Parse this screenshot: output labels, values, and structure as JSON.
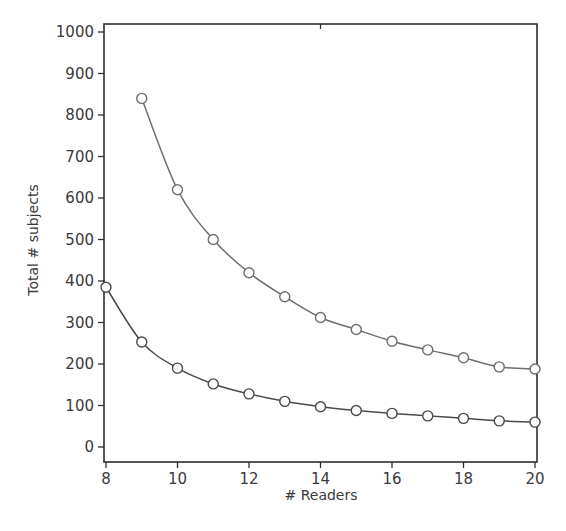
{
  "chart_data": {
    "type": "line",
    "title": "",
    "xlabel": "# Readers",
    "ylabel": "Total # subjects",
    "xlim": [
      8,
      20
    ],
    "ylim": [
      0,
      1000
    ],
    "x_ticks": [
      8,
      10,
      12,
      14,
      16,
      18,
      20
    ],
    "y_ticks": [
      0,
      100,
      200,
      300,
      400,
      500,
      600,
      700,
      800,
      900,
      1000
    ],
    "grid": false,
    "legend": null,
    "marker": "open-circle",
    "series": [
      {
        "name": "upper",
        "color": "#6e6e6e",
        "x": [
          9,
          10,
          11,
          12,
          13,
          14,
          15,
          16,
          17,
          18,
          19,
          20
        ],
        "values": [
          840,
          620,
          500,
          420,
          362,
          312,
          283,
          255,
          234,
          215,
          193,
          188
        ]
      },
      {
        "name": "lower",
        "color": "#4a4a4a",
        "x": [
          8,
          9,
          10,
          11,
          12,
          13,
          14,
          15,
          16,
          17,
          18,
          19,
          20
        ],
        "values": [
          385,
          253,
          190,
          152,
          128,
          110,
          97,
          88,
          81,
          75,
          69,
          63,
          60
        ]
      }
    ]
  }
}
